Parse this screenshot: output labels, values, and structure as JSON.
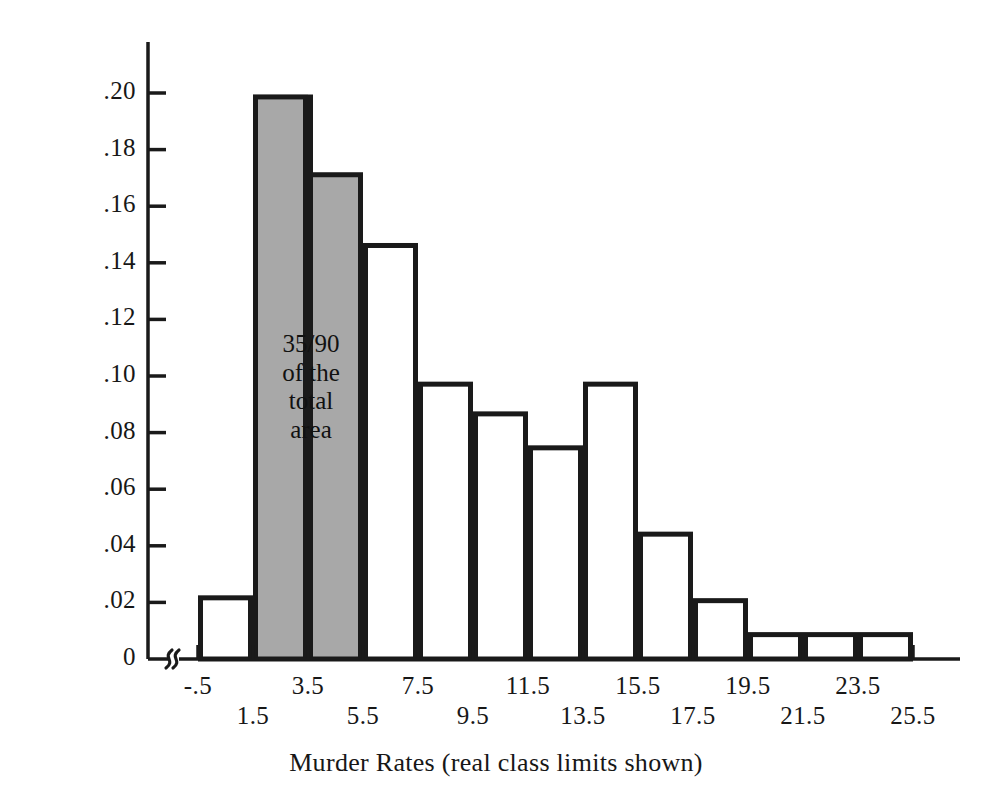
{
  "chart_data": {
    "type": "bar",
    "title": "",
    "xlabel": "Murder Rates (real class limits shown)",
    "ylabel": "Relative Frequency",
    "categories": [
      "-.5 to 1.5",
      "1.5 to 3.5",
      "3.5 to 5.5",
      "5.5 to 7.5",
      "7.5 to 9.5",
      "9.5 to 11.5",
      "11.5 to 13.5",
      "13.5 to 15.5",
      "15.5 to 17.5",
      "17.5 to 19.5",
      "19.5 to 21.5",
      "21.5 to 23.5",
      "23.5 to 25.5"
    ],
    "values": [
      0.0225,
      0.1995,
      0.172,
      0.147,
      0.098,
      0.0875,
      0.0755,
      0.098,
      0.045,
      0.0215,
      0.0095,
      0.0095,
      0.0095
    ],
    "bin_edges": [
      -0.5,
      1.5,
      3.5,
      5.5,
      7.5,
      9.5,
      11.5,
      13.5,
      15.5,
      17.5,
      19.5,
      21.5,
      23.5,
      25.5
    ],
    "highlighted_bins": [
      1,
      2
    ],
    "highlight_color": "#a8a8a8",
    "bar_edge_color": "#1a1a1a",
    "bar_face_color": "#ffffff",
    "ylim": [
      0,
      0.215
    ],
    "grid": false,
    "legend": null,
    "axis_break_on_x": true,
    "annotation": {
      "text": "35/90\nof the\ntotal\narea",
      "at_bin_boundary": 3.5
    },
    "ytick_values": [
      0,
      0.02,
      0.04,
      0.06,
      0.08,
      0.1,
      0.12,
      0.14,
      0.16,
      0.18,
      0.2
    ],
    "ytick_labels": [
      "0",
      ".02",
      ".04",
      ".06",
      ".08",
      ".10",
      ".12",
      ".14",
      ".16",
      ".18",
      ".20"
    ],
    "xtick_values": [
      -0.5,
      1.5,
      3.5,
      5.5,
      7.5,
      9.5,
      11.5,
      13.5,
      15.5,
      17.5,
      19.5,
      21.5,
      23.5,
      25.5
    ],
    "xtick_labels": [
      "-.5",
      "1.5",
      "3.5",
      "5.5",
      "7.5",
      "9.5",
      "11.5",
      "13.5",
      "15.5",
      "17.5",
      "19.5",
      "21.5",
      "23.5",
      "25.5"
    ],
    "xtick_label_rows": [
      0,
      1,
      0,
      1,
      0,
      1,
      0,
      1,
      0,
      1,
      0,
      1,
      0,
      1
    ]
  },
  "axes": {
    "y_label": "Relative Frequency",
    "x_label": "Murder Rates (real class limits shown)"
  }
}
